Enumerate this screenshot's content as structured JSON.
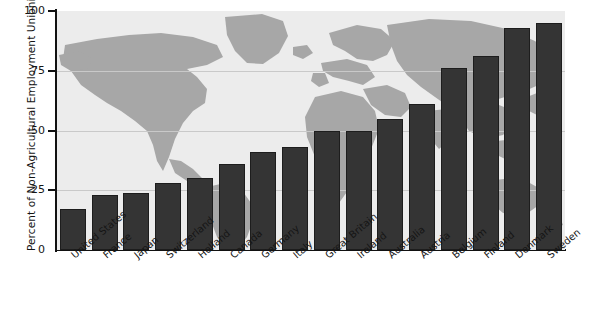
{
  "chart_data": {
    "type": "bar",
    "title": "",
    "xlabel": "",
    "ylabel": "Percent of Non-Agricultural Employment Unionized",
    "ylim": [
      0,
      100
    ],
    "yticks": [
      0,
      25,
      50,
      75,
      100
    ],
    "ytick_labels": [
      "0",
      "25",
      "50",
      "75",
      "100"
    ],
    "grid": "horizontal",
    "legend": "none",
    "background_image": "world-map-watermark",
    "bar_color": "#343434",
    "plot_background_color": "#ececec",
    "map_color": "#a7a7a7",
    "gridline_color": "#c9c9c9",
    "categories": [
      "United States",
      "France",
      "Japan",
      "Switzerland",
      "Holland",
      "Canada",
      "Germany",
      "Italy",
      "Great Britain",
      "Ireland",
      "Australia",
      "Austria",
      "Belgium",
      "Finland",
      "Denmark",
      "Sweden"
    ],
    "values": [
      17,
      23,
      24,
      28,
      30,
      36,
      41,
      43,
      50,
      50,
      55,
      61,
      76,
      81,
      93,
      95
    ]
  }
}
